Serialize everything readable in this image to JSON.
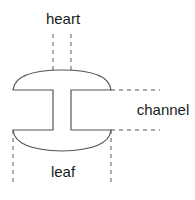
{
  "diagram": {
    "labels": {
      "heart": "heart",
      "channel": "channel",
      "leaf": "leaf"
    },
    "colors": {
      "stroke": "#555555",
      "text": "#1a1a1a",
      "background": "#ffffff"
    }
  }
}
